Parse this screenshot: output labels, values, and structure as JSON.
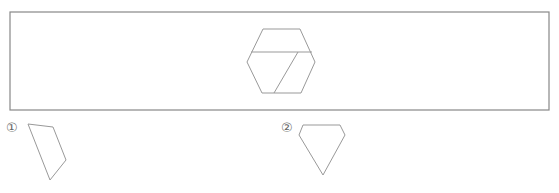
{
  "figure": {
    "frame": {
      "x": 10,
      "y": 12,
      "width": 539,
      "height": 98,
      "stroke": "#888888"
    },
    "hexagon": {
      "outline": [
        [
          263,
          29
        ],
        [
          300,
          29
        ],
        [
          315,
          62
        ],
        [
          301,
          93
        ],
        [
          262,
          93
        ],
        [
          247,
          62
        ]
      ],
      "inner_lines": [
        [
          [
            251,
            52
          ],
          [
            312,
            52
          ]
        ],
        [
          [
            298,
            52
          ],
          [
            274,
            93
          ]
        ]
      ],
      "stroke": "#999999"
    }
  },
  "options": [
    {
      "label": "①",
      "label_pos": [
        6,
        128
      ],
      "shape": [
        [
          28,
          124
        ],
        [
          53,
          127
        ],
        [
          66,
          160
        ],
        [
          50,
          180
        ]
      ]
    },
    {
      "label": "②",
      "label_pos": [
        281,
        128
      ],
      "shape": [
        [
          303,
          125
        ],
        [
          340,
          125
        ],
        [
          345,
          135
        ],
        [
          323,
          175
        ],
        [
          299,
          135
        ]
      ]
    }
  ],
  "colors": {
    "stroke": "#999999",
    "frame": "#888888",
    "label": "#666666"
  }
}
